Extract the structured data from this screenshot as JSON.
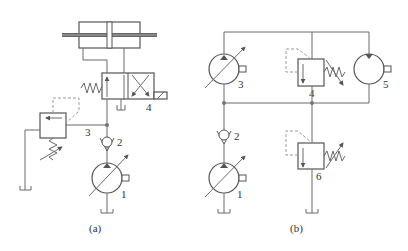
{
  "figure": {
    "type": "hydraulic-circuit-schematic",
    "subfigures": [
      {
        "id": "a",
        "caption": "(a)",
        "components": [
          {
            "number": "1",
            "label": "1",
            "kind": "variable-displacement-pump"
          },
          {
            "number": "2",
            "label": "2",
            "kind": "check-valve"
          },
          {
            "number": "3",
            "label": "3",
            "kind": "relief-valve"
          },
          {
            "number": "4",
            "label": "4",
            "kind": "directional-control-valve-solenoid-spring"
          },
          {
            "kind": "double-rod-hydraulic-cylinder"
          }
        ]
      },
      {
        "id": "b",
        "caption": "(b)",
        "components": [
          {
            "number": "1",
            "label": "1",
            "kind": "variable-displacement-pump"
          },
          {
            "number": "2",
            "label": "2",
            "kind": "check-valve"
          },
          {
            "number": "3",
            "label": "3",
            "kind": "variable-displacement-pump"
          },
          {
            "number": "4",
            "label": "4",
            "kind": "relief-valve"
          },
          {
            "number": "5",
            "label": "5",
            "kind": "hydraulic-motor"
          },
          {
            "number": "6",
            "label": "6",
            "kind": "relief-valve"
          }
        ]
      }
    ]
  }
}
